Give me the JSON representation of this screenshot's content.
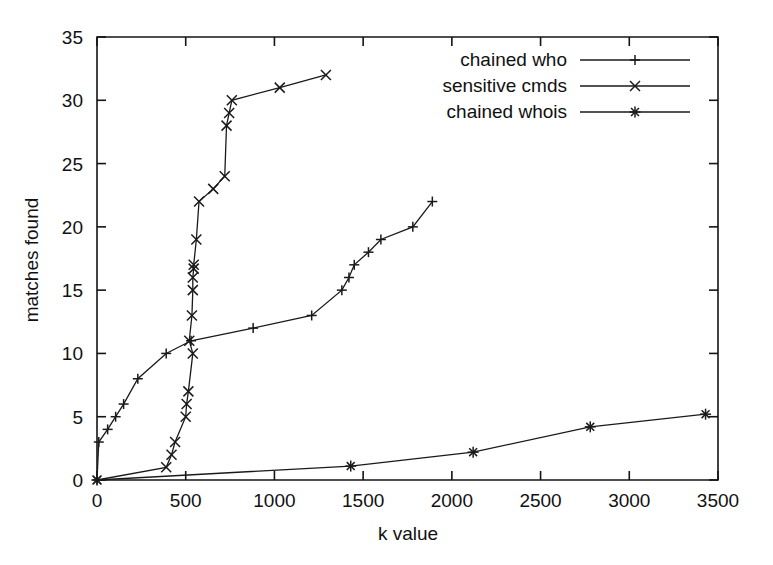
{
  "chart_data": {
    "type": "line",
    "title": "",
    "xlabel": "k value",
    "ylabel": "matches found",
    "xlim": [
      0,
      3500
    ],
    "ylim": [
      0,
      35
    ],
    "xticks": [
      0,
      500,
      1000,
      1500,
      2000,
      2500,
      3000,
      3500
    ],
    "yticks": [
      0,
      5,
      10,
      15,
      20,
      25,
      30,
      35
    ],
    "grid": false,
    "legend_position": "top-right",
    "series": [
      {
        "name": "chained who",
        "marker": "plus",
        "color": "#1a1a1a",
        "points": [
          [
            0,
            0
          ],
          [
            10,
            3
          ],
          [
            60,
            4
          ],
          [
            105,
            5
          ],
          [
            150,
            6
          ],
          [
            230,
            8
          ],
          [
            390,
            10
          ],
          [
            530,
            11
          ],
          [
            880,
            12
          ],
          [
            1210,
            13
          ],
          [
            1380,
            15
          ],
          [
            1420,
            16
          ],
          [
            1450,
            17
          ],
          [
            1530,
            18
          ],
          [
            1600,
            19
          ],
          [
            1780,
            20
          ],
          [
            1890,
            22
          ]
        ]
      },
      {
        "name": "sensitive cmds",
        "marker": "cross",
        "color": "#1a1a1a",
        "points": [
          [
            0,
            0
          ],
          [
            390,
            1
          ],
          [
            420,
            2
          ],
          [
            440,
            3
          ],
          [
            500,
            5
          ],
          [
            505,
            6
          ],
          [
            515,
            7
          ],
          [
            540,
            10
          ],
          [
            520,
            11
          ],
          [
            535,
            13
          ],
          [
            540,
            15
          ],
          [
            540,
            16
          ],
          [
            545,
            16.7
          ],
          [
            545,
            17
          ],
          [
            560,
            19
          ],
          [
            575,
            22
          ],
          [
            655,
            23
          ],
          [
            720,
            24
          ],
          [
            730,
            28
          ],
          [
            745,
            29
          ],
          [
            760,
            30
          ],
          [
            1030,
            31
          ],
          [
            1290,
            32
          ]
        ]
      },
      {
        "name": "chained whois",
        "marker": "asterisk",
        "color": "#1a1a1a",
        "points": [
          [
            0,
            0
          ],
          [
            1430,
            1.1
          ],
          [
            2120,
            2.2
          ],
          [
            2780,
            4.2
          ],
          [
            3430,
            5.2
          ]
        ]
      }
    ]
  },
  "legend": {
    "entries": [
      {
        "label": "chained who"
      },
      {
        "label": "sensitive cmds"
      },
      {
        "label": "chained whois"
      }
    ]
  }
}
